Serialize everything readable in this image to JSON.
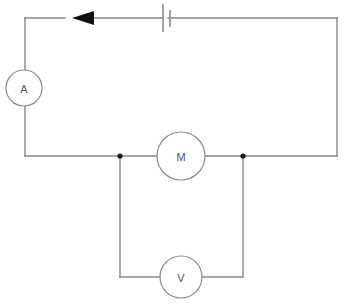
{
  "diagram": {
    "type": "circuit-schematic",
    "colors": {
      "wire": "#888888",
      "component_outline": "#8a8a8a",
      "label_text": "#555555",
      "junction": "#1a1a1a",
      "arrow": "#111111",
      "background": "#ffffff"
    },
    "components": [
      {
        "id": "ammeter",
        "symbol": "circle",
        "label": "A",
        "name": "ammeter",
        "cx": 24,
        "cy": 88,
        "r": 18
      },
      {
        "id": "battery",
        "symbol": "battery-cell",
        "label": "",
        "name": "battery",
        "x": 162,
        "y": 18
      },
      {
        "id": "motor",
        "symbol": "circle",
        "label": "M",
        "name": "motor",
        "cx": 181,
        "cy": 156,
        "r": 24
      },
      {
        "id": "voltmeter",
        "symbol": "circle",
        "label": "V",
        "name": "voltmeter",
        "cx": 181,
        "cy": 277,
        "r": 21
      }
    ],
    "current_arrow": {
      "name": "current-direction-arrow",
      "direction": "left",
      "tip_x": 72,
      "tip_y": 18,
      "length": 22,
      "half_height": 7
    },
    "junctions": [
      {
        "name": "junction-left",
        "cx": 120,
        "cy": 156,
        "r": 2.6
      },
      {
        "name": "junction-right",
        "cx": 243,
        "cy": 156,
        "r": 2.6
      }
    ],
    "wires": {
      "main_loop_top_left": "M 25 18 L 65 18",
      "main_loop_top_battery_left": "M 78 18 L 162 18",
      "main_loop_top_battery_right": "M 168 18 L 337 18",
      "main_loop_right": "M 337 18 L 337 156",
      "main_loop_bottom_right": "M 337 156 L 243 156",
      "motor_right_lead": "M 243 156 L 205 156",
      "motor_left_lead": "M 157 156 L 120 156",
      "main_loop_bottom_left": "M 120 156 L 25 156",
      "main_loop_left_lower": "M 25 156 L 25 106",
      "main_loop_left_upper": "M 25 70 L 25 18",
      "branch_left_vertical": "M 120 156 L 120 277",
      "branch_left_horizontal": "M 120 277 L 160 277",
      "branch_right_horizontal": "M 202 277 L 243 277",
      "branch_right_vertical": "M 243 277 L 243 156"
    }
  }
}
